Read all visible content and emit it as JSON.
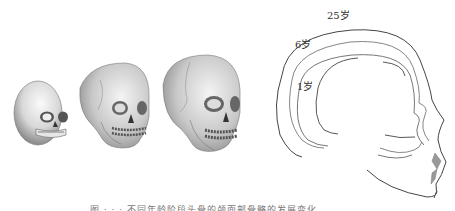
{
  "figure": {
    "left_panel": {
      "description": "Three skulls of increasing size (infant, child, adult)",
      "skulls": [
        {
          "id": "infant"
        },
        {
          "id": "child"
        },
        {
          "id": "adult"
        }
      ]
    },
    "right_panel": {
      "description": "Profile outlines of skull growth",
      "labels": [
        {
          "text": "25岁",
          "color": "#333333"
        },
        {
          "text": "6岁",
          "color": "#333333"
        },
        {
          "text": "1岁",
          "color": "#333333"
        }
      ],
      "line_colors": {
        "adult": "#444444",
        "child": "#777777",
        "infant": "#555555",
        "lips": "#999999"
      }
    },
    "caption": "图 · · · 不同年龄阶段头骨的颅面部骨骼的发展变化"
  }
}
